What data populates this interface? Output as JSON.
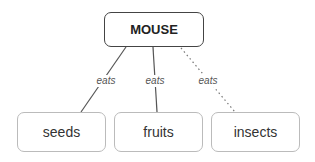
{
  "diagram": {
    "root": {
      "label": "MOUSE"
    },
    "children": [
      {
        "label": "seeds",
        "edge_label": "eats",
        "edge_style": "solid"
      },
      {
        "label": "fruits",
        "edge_label": "eats",
        "edge_style": "solid"
      },
      {
        "label": "insects",
        "edge_label": "eats",
        "edge_style": "dotted"
      }
    ]
  },
  "colors": {
    "root_border": "#444444",
    "leaf_border": "#bbbbbb",
    "edge": "#555555",
    "text": "#222222"
  }
}
